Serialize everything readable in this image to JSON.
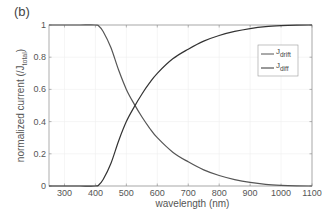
{
  "panel_label": "(b)",
  "chart_data": {
    "type": "line",
    "title": "",
    "xlabel": "wavelength (nm)",
    "ylabel": "normalized current (/J_total)",
    "ylabel_main": "normalized current (/J",
    "ylabel_sub": "total",
    "ylabel_end": ")",
    "xlim": [
      250,
      1100
    ],
    "ylim": [
      0,
      1
    ],
    "xticks": [
      300,
      400,
      500,
      600,
      700,
      800,
      900,
      1000,
      1100
    ],
    "yticks": [
      0,
      0.2,
      0.4,
      0.6,
      0.8,
      1
    ],
    "ytick_labels": [
      "0",
      "0.2",
      "0.4",
      "0.6",
      "0.8",
      "1"
    ],
    "grid": true,
    "legend_position": "upper right (inside)",
    "x": [
      250,
      300,
      350,
      400,
      410,
      425,
      450,
      475,
      500,
      525,
      550,
      575,
      600,
      650,
      700,
      750,
      800,
      850,
      900,
      950,
      1000,
      1050,
      1100
    ],
    "series": [
      {
        "name": "J_drift",
        "label_main": "J",
        "label_sub": "drift",
        "color": "#555555",
        "values": [
          1,
          1,
          1,
          1,
          0.995,
          0.96,
          0.86,
          0.72,
          0.6,
          0.51,
          0.43,
          0.36,
          0.3,
          0.21,
          0.15,
          0.1,
          0.065,
          0.04,
          0.022,
          0.01,
          0.004,
          0.001,
          0
        ]
      },
      {
        "name": "J_diff",
        "label_main": "J",
        "label_sub": "diff",
        "color": "#333333",
        "values": [
          0,
          0,
          0,
          0,
          0.005,
          0.04,
          0.14,
          0.28,
          0.4,
          0.49,
          0.57,
          0.64,
          0.7,
          0.79,
          0.85,
          0.9,
          0.935,
          0.96,
          0.978,
          0.99,
          0.996,
          0.999,
          1
        ]
      }
    ]
  }
}
